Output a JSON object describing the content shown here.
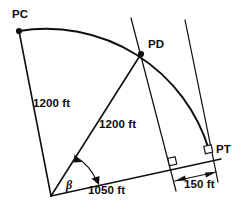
{
  "diagram": {
    "stroke_color": "#101010",
    "background_color": "#ffffff",
    "points": {
      "pc_label": "PC",
      "pd_label": "PD",
      "pt_label": "PT"
    },
    "dimensions": {
      "radius_pc": "1200 ft",
      "radius_pd": "1200 ft",
      "baseline": "1050 ft",
      "offset": "150 ft"
    },
    "angles": {
      "beta": "β"
    },
    "geometry": {
      "center": {
        "x": 51,
        "y": 196
      },
      "pc": {
        "x": 19,
        "y": 31
      },
      "pd": {
        "x": 141,
        "y": 54
      },
      "pt": {
        "x": 209,
        "y": 150
      },
      "radius_px": 167,
      "baseline_end": {
        "x": 221,
        "y": 159
      },
      "pd_perp_foot": {
        "x": 173,
        "y": 163
      },
      "tangent_top": {
        "x": 185,
        "y": 20
      },
      "tangent_bottom": {
        "x": 218,
        "y": 182
      },
      "pd_line_top": {
        "x": 131,
        "y": 18
      },
      "pd_line_bottom": {
        "x": 176,
        "y": 191
      }
    }
  }
}
